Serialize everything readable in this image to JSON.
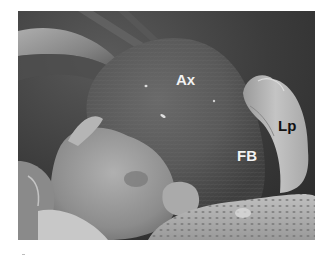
{
  "figure": {
    "type": "scanning electron micrograph",
    "labels": {
      "ax": "Ax",
      "fb": "FB",
      "lp": "Lp"
    },
    "colors": {
      "background": "#3a3a3a",
      "structure_dark": "#555555",
      "structure_light": "#c8c8c8",
      "label_light": "#f2f2f2",
      "label_dark": "#111111"
    }
  }
}
